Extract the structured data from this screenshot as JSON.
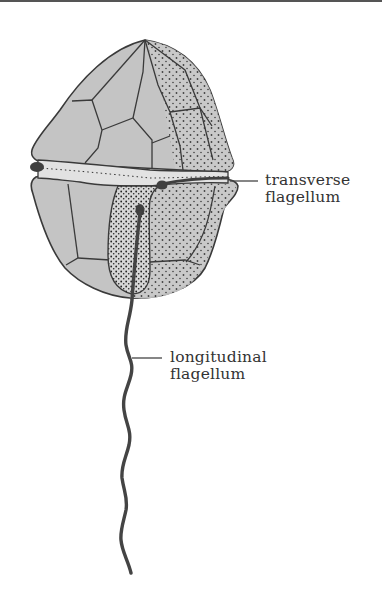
{
  "diagram": {
    "labels": {
      "transverse": {
        "line1": "transverse",
        "line2": "flagellum"
      },
      "longitudinal": {
        "line1": "longitudinal",
        "line2": "flagellum"
      }
    },
    "colors": {
      "plate_fill": "#c4c4c4",
      "outline": "#3a3a3a",
      "flagellum": "#444444",
      "groove_fill": "#dedede",
      "text": "#333333"
    }
  }
}
